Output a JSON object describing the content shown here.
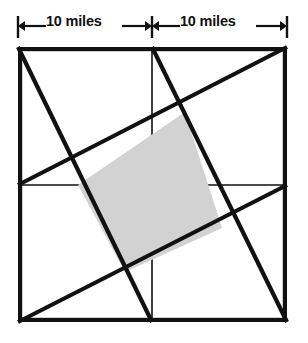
{
  "figure": {
    "background_color": "#ffffff",
    "line_color": "#111111",
    "shaded_fill_color": "#d2d2d2"
  },
  "dimensions": {
    "left_label": "10 miles",
    "right_label": "10 miles",
    "unit": "miles",
    "left_value": 10,
    "right_value": 10,
    "total_side_label": "20 miles",
    "dimension_line_y": 26
  },
  "outer_square": {
    "name": "outer-square",
    "left": 18,
    "top": 47,
    "right": 287,
    "bottom": 322,
    "stroke_width": 4.2
  },
  "midlines": [
    {
      "name": "vertical-midline",
      "orientation": "vertical",
      "x1": 152,
      "y1": 47,
      "x2": 152,
      "y2": 322,
      "stroke_width": 1.6
    },
    {
      "name": "horizontal-midline",
      "orientation": "horizontal",
      "x1": 18,
      "y1": 185,
      "x2": 287,
      "y2": 185,
      "stroke_width": 1.6
    }
  ],
  "diagonals": [
    {
      "name": "diagonal-top-left-to-bottom-midpoint",
      "x1": 18,
      "y1": 47,
      "x2": 152,
      "y2": 322,
      "stroke_width": 4.2
    },
    {
      "name": "diagonal-top-midpoint-to-bottom-right",
      "x1": 152,
      "y1": 47,
      "x2": 287,
      "y2": 322,
      "stroke_width": 4.2
    },
    {
      "name": "diagonal-top-right-to-left-midpoint",
      "x1": 287,
      "y1": 47,
      "x2": 18,
      "y2": 185,
      "stroke_width": 4.2
    },
    {
      "name": "diagonal-bottom-left-to-right-midpoint",
      "x1": 18,
      "y1": 322,
      "x2": 287,
      "y2": 185,
      "stroke_width": 4.2
    }
  ],
  "shaded_quadrilateral": {
    "name": "shaded-quadrilateral",
    "points": "185,112 222,228 125,272 78,185",
    "vertices": [
      {
        "label": "top",
        "x": 185,
        "y": 112
      },
      {
        "label": "right",
        "x": 222,
        "y": 228
      },
      {
        "label": "bottom",
        "x": 125,
        "y": 272
      },
      {
        "label": "left",
        "x": 78,
        "y": 185
      }
    ],
    "fill": "#d2d2d2",
    "stroke_width": 4.2
  },
  "dimension_markers": {
    "left_tick_x": 18,
    "center_tick_x": 152,
    "right_tick_x": 287,
    "tick_top": 16,
    "tick_bottom": 38,
    "arrow_size": 7
  }
}
